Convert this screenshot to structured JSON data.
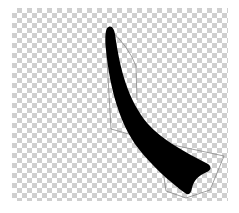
{
  "canvas": {
    "background": "transparency-checkerboard",
    "checker_color": "#cfcfcf",
    "checker_size_px": 5
  },
  "shape": {
    "name": "horn-shape",
    "fill": "#000000",
    "selected": true
  },
  "bezier_outline": {
    "stroke": "#8a8a8a"
  }
}
